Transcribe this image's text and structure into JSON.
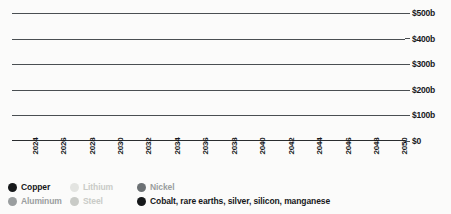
{
  "chart_data": {
    "type": "bar",
    "title": "",
    "subtitle": "",
    "xlabel": "",
    "ylabel": "",
    "stacked": true,
    "grid": true,
    "legend_position": "bottom-left",
    "ylim": [
      0,
      500
    ],
    "yticks": [
      0,
      100,
      200,
      300,
      400,
      500
    ],
    "ytick_labels": [
      "$0",
      "$100b",
      "$200b",
      "$300b",
      "$400b",
      "$500b"
    ],
    "categories": [
      "2023",
      "2024",
      "2025",
      "2026",
      "2027",
      "2028",
      "2029",
      "2030",
      "2031",
      "2032",
      "2033",
      "2034",
      "2035",
      "2036",
      "2037",
      "2038",
      "2039",
      "2040",
      "2041",
      "2042",
      "2043",
      "2044",
      "2045",
      "2046",
      "2047",
      "2048",
      "2049",
      "2050"
    ],
    "xtick_labels_shown": [
      "",
      "2024",
      "",
      "2026",
      "",
      "2028",
      "",
      "2030",
      "",
      "2032",
      "",
      "2034",
      "",
      "2036",
      "",
      "2038",
      "",
      "2040",
      "",
      "2042",
      "",
      "2044",
      "",
      "2046",
      "",
      "2048",
      "",
      "2050"
    ],
    "series": [
      {
        "name": "Copper",
        "color": "#3c3c3c",
        "values": [
          45,
          52,
          58,
          72,
          80,
          83,
          86,
          108,
          111,
          112,
          122,
          128,
          132,
          136,
          137,
          137,
          138,
          140,
          140,
          140,
          136,
          135,
          128,
          126,
          122,
          121,
          121,
          122
        ]
      },
      {
        "name": "Aluminum",
        "color": "#8e9295",
        "values": [
          30,
          33,
          47,
          52,
          55,
          56,
          58,
          68,
          69,
          70,
          78,
          82,
          86,
          88,
          88,
          88,
          89,
          90,
          90,
          90,
          86,
          85,
          79,
          78,
          75,
          74,
          74,
          75
        ]
      },
      {
        "name": "Lithium",
        "color": "#e3e4e1",
        "values": [
          25,
          28,
          48,
          52,
          54,
          55,
          58,
          70,
          70,
          70,
          78,
          84,
          88,
          92,
          91,
          90,
          91,
          92,
          92,
          91,
          85,
          84,
          76,
          75,
          72,
          71,
          71,
          71
        ]
      },
      {
        "name": "Steel",
        "color": "#c9cbc7",
        "values": [
          15,
          17,
          22,
          24,
          25,
          26,
          27,
          30,
          31,
          31,
          33,
          34,
          36,
          37,
          37,
          37,
          37,
          37,
          37,
          37,
          35,
          35,
          33,
          32,
          31,
          31,
          31,
          31
        ]
      },
      {
        "name": "Nickel",
        "color": "#6c7174",
        "values": [
          25,
          27,
          36,
          39,
          41,
          42,
          44,
          52,
          53,
          54,
          58,
          62,
          64,
          66,
          66,
          66,
          66,
          67,
          67,
          66,
          62,
          61,
          56,
          56,
          53,
          53,
          53,
          53
        ]
      },
      {
        "name": "Cobalt, rare earths, silver, silicon, manganese",
        "color": "#16181a",
        "values": [
          13,
          14,
          18,
          19,
          20,
          20,
          22,
          25,
          26,
          26,
          28,
          30,
          32,
          33,
          33,
          33,
          33,
          33,
          33,
          33,
          31,
          30,
          28,
          28,
          27,
          27,
          27,
          27
        ]
      }
    ]
  },
  "legend": {
    "items": [
      {
        "label": "Copper",
        "color": "#16181a",
        "tone": "dark"
      },
      {
        "label": "Lithium",
        "color": "#e3e4e1",
        "tone": "light"
      },
      {
        "label": "Nickel",
        "color": "#6c7174",
        "tone": "mid"
      },
      {
        "label": "Aluminum",
        "color": "#9a9e9f",
        "tone": "mid"
      },
      {
        "label": "Steel",
        "color": "#c9cbc7",
        "tone": "light"
      },
      {
        "label": "Cobalt, rare earths, silver, silicon, manganese",
        "color": "#16181a",
        "tone": "dark"
      }
    ]
  }
}
